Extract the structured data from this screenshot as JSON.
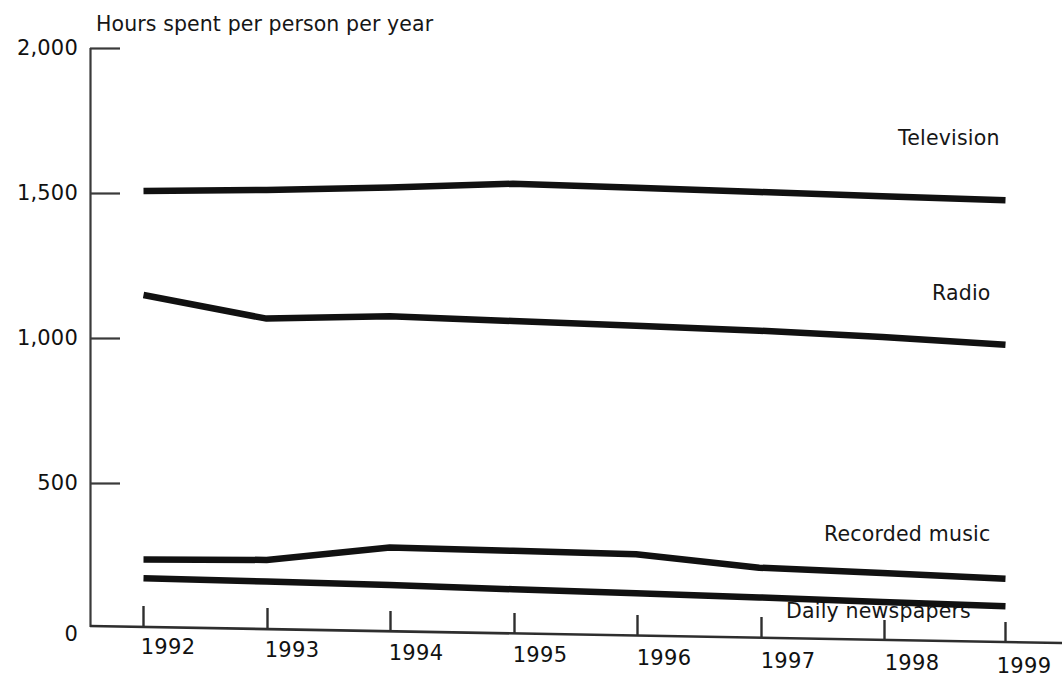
{
  "chart_data": {
    "type": "line",
    "title": "Hours spent per person per year",
    "subtitle": "",
    "xlabel": "",
    "ylabel": "",
    "categories": [
      "1992",
      "1993",
      "1994",
      "1995",
      "1996",
      "1997",
      "1998",
      "1999"
    ],
    "x": [
      1992,
      1993,
      1994,
      1995,
      1996,
      1997,
      1998,
      1999
    ],
    "xlim": [
      1992,
      1999
    ],
    "ylim": [
      0,
      2000
    ],
    "yticks": [
      0,
      500,
      1000,
      1500,
      2000
    ],
    "ytick_labels": [
      "0",
      "500",
      "1,000",
      "1,500",
      "2,000"
    ],
    "grid": false,
    "legend": "inline-right-labels",
    "series": [
      {
        "name": "Television",
        "label": "Television",
        "color": "#111111",
        "values": [
          1510,
          1520,
          1535,
          1555,
          1548,
          1540,
          1532,
          1525
        ]
      },
      {
        "name": "Radio",
        "label": "Radio",
        "color": "#111111",
        "values": [
          1150,
          1075,
          1090,
          1080,
          1070,
          1060,
          1045,
          1025
        ]
      },
      {
        "name": "Recorded music",
        "label": "Recorded music",
        "color": "#111111",
        "values": [
          235,
          240,
          290,
          285,
          280,
          240,
          228,
          215
        ]
      },
      {
        "name": "Daily newspapers",
        "label": "Daily newspapers",
        "color": "#111111",
        "values": [
          170,
          165,
          160,
          152,
          145,
          137,
          128,
          120
        ]
      }
    ]
  },
  "axis": {
    "ytick_labels": [
      "2,000",
      "1,500",
      "1,000",
      "500",
      "0"
    ],
    "xtick_labels": [
      "1992",
      "1993",
      "1994",
      "1995",
      "1996",
      "1997",
      "1998",
      "1999"
    ]
  },
  "labels": {
    "television": "Television",
    "radio": "Radio",
    "recorded_music": "Recorded music",
    "daily_newspapers": "Daily newspapers"
  },
  "title": "Hours spent per person per year",
  "colors": {
    "line": "#111111",
    "axis": "#333333",
    "background": "#ffffff",
    "text": "#141414"
  }
}
